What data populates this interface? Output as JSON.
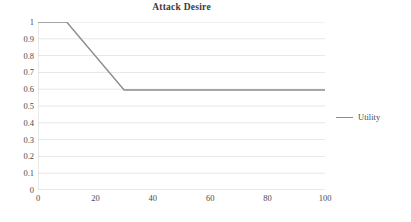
{
  "chart_data": {
    "type": "line",
    "title": "Attack Desire",
    "xlabel": "",
    "ylabel": "",
    "xlim": [
      0,
      100
    ],
    "ylim": [
      0,
      1
    ],
    "grid": true,
    "grid_axis": "y",
    "legend_position": "right",
    "x_ticks": [
      0,
      20,
      40,
      60,
      80,
      100
    ],
    "x_tick_labels": [
      "0",
      "20",
      "40",
      "60",
      "80",
      "100"
    ],
    "y_ticks": [
      0,
      0.1,
      0.2,
      0.3,
      0.4,
      0.5,
      0.6,
      0.7,
      0.8,
      0.9,
      1
    ],
    "y_tick_labels": [
      "0",
      "0.1",
      "0.2",
      "0.3",
      "0.4",
      "0.5",
      "0.6",
      "0.7",
      "0.8",
      "0.9",
      "1"
    ],
    "series": [
      {
        "name": "Utility",
        "color": "#8c8c8c",
        "x": [
          0,
          10,
          30,
          100
        ],
        "values": [
          1,
          1,
          0.595,
          0.595
        ]
      }
    ]
  },
  "legend": {
    "entries": [
      {
        "label": "Utility",
        "color": "#8c8c8c",
        "marker": "line-swatch"
      }
    ]
  },
  "style": {
    "series_color": "#8c8c8c",
    "grid_color": "#e6e6e6",
    "axis_color": "#d4d4d4",
    "text_color": "#4a4a4a",
    "title_color": "#3a3a3a",
    "background": "#ffffff"
  }
}
